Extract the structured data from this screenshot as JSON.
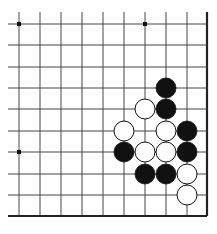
{
  "board": {
    "description": "Go board fragment (lower-right corner region)",
    "cols_x": [
      19,
      40,
      61,
      82,
      103,
      124,
      145,
      166,
      187,
      207
    ],
    "rows_y": [
      24,
      45,
      67,
      88,
      109,
      131,
      152,
      174,
      195,
      216
    ],
    "line_start_x": 8,
    "line_start_y": 12,
    "right_edge_x": 207,
    "bottom_edge_y": 216,
    "line_color": "#444444",
    "edge_color": "#222222",
    "star_points": [
      [
        0,
        0
      ],
      [
        6,
        0
      ],
      [
        0,
        6
      ]
    ],
    "stone_radius": 10,
    "stones": [
      {
        "color": "black",
        "col": 7,
        "row": 3
      },
      {
        "color": "white",
        "col": 6,
        "row": 4
      },
      {
        "color": "black",
        "col": 7,
        "row": 4
      },
      {
        "color": "white",
        "col": 5,
        "row": 5
      },
      {
        "color": "white",
        "col": 7,
        "row": 5
      },
      {
        "color": "black",
        "col": 8,
        "row": 5
      },
      {
        "color": "black",
        "col": 5,
        "row": 6
      },
      {
        "color": "white",
        "col": 6,
        "row": 6
      },
      {
        "color": "white",
        "col": 7,
        "row": 6
      },
      {
        "color": "black",
        "col": 8,
        "row": 6
      },
      {
        "color": "black",
        "col": 6,
        "row": 7
      },
      {
        "color": "black",
        "col": 7,
        "row": 7
      },
      {
        "color": "white",
        "col": 8,
        "row": 7
      },
      {
        "color": "white",
        "col": 8,
        "row": 8
      }
    ]
  }
}
